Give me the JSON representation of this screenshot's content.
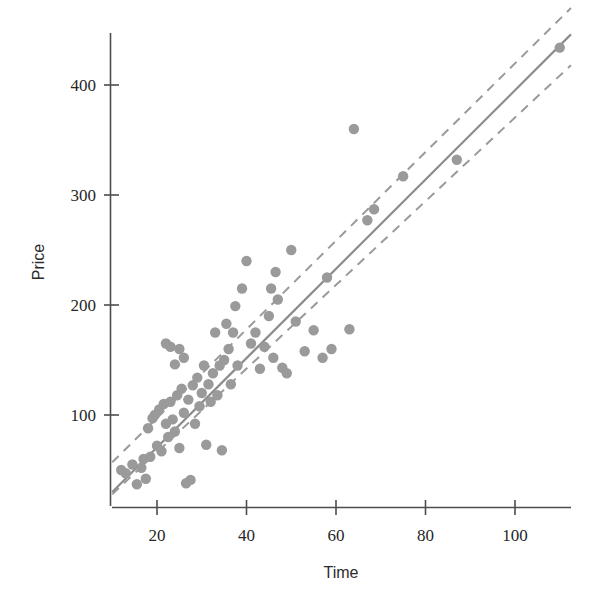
{
  "figure": {
    "title": "",
    "background_color": "#ffffff",
    "width": 606,
    "height": 609
  },
  "axes": {
    "x": {
      "label": "Time",
      "ticks": [
        20,
        40,
        60,
        80,
        100
      ],
      "tick_labels": [
        "20",
        "40",
        "60",
        "80",
        "100"
      ],
      "range": [
        10,
        112.5
      ],
      "axis_color": "#4d4d4d"
    },
    "y": {
      "label": "Price",
      "ticks": [
        100,
        200,
        300,
        400
      ],
      "tick_labels": [
        "100",
        "200",
        "300",
        "400"
      ],
      "range": [
        28,
        457
      ],
      "axis_color": "#4d4d4d"
    }
  },
  "style": {
    "point_color": "#9a9a9a",
    "point_radius": 5.2,
    "fit_line_color": "#8c8c8c",
    "band_line_color": "#9a9a9a",
    "fit_line_width": 2.2,
    "band_line_width": 2.0,
    "band_dash": "9 7",
    "grid": false,
    "legend": "none"
  },
  "chart_data": {
    "type": "scatter",
    "title": "",
    "xlabel": "Time",
    "ylabel": "Price",
    "xlim": [
      10,
      112.5
    ],
    "ylim": [
      28,
      457
    ],
    "xticks": [
      20,
      40,
      60,
      80,
      100
    ],
    "yticks": [
      100,
      200,
      300,
      400
    ],
    "grid": false,
    "legend": "none",
    "series": [
      {
        "name": "observations",
        "marker": "circle",
        "color": "#9a9a9a",
        "x": [
          12.0,
          13.0,
          14.5,
          15.5,
          16.5,
          17.0,
          17.5,
          18.0,
          18.5,
          19.0,
          19.5,
          20.0,
          20.5,
          21.0,
          21.5,
          22.0,
          22.0,
          22.5,
          23.0,
          23.0,
          23.5,
          24.0,
          24.0,
          24.5,
          25.0,
          25.0,
          25.5,
          26.0,
          26.0,
          26.5,
          27.0,
          27.5,
          28.0,
          28.5,
          29.0,
          29.5,
          30.0,
          30.5,
          31.0,
          31.5,
          32.0,
          32.5,
          33.0,
          33.5,
          34.0,
          34.5,
          35.0,
          35.5,
          36.0,
          36.5,
          37.0,
          37.5,
          38.0,
          39.0,
          40.0,
          41.0,
          42.0,
          43.0,
          44.0,
          45.0,
          45.5,
          46.0,
          46.5,
          47.0,
          48.0,
          49.0,
          50.0,
          51.0,
          53.0,
          55.0,
          57.0,
          58.0,
          59.0,
          63.0,
          64.0,
          67.0,
          68.5,
          75.0,
          87.0,
          110.0
        ],
        "y": [
          50,
          47,
          55,
          37,
          52,
          60,
          42,
          88,
          62,
          97,
          100,
          72,
          105,
          67,
          110,
          92,
          165,
          80,
          112,
          162,
          96,
          85,
          146,
          118,
          70,
          160,
          124,
          102,
          152,
          38,
          114,
          41,
          127,
          92,
          134,
          108,
          120,
          145,
          73,
          128,
          112,
          138,
          175,
          118,
          145,
          68,
          150,
          183,
          160,
          128,
          175,
          199,
          145,
          215,
          240,
          165,
          175,
          142,
          162,
          190,
          215,
          152,
          230,
          205,
          143,
          138,
          250,
          185,
          158,
          177,
          152,
          225,
          160,
          178,
          360,
          277,
          287,
          317,
          332,
          434
        ]
      }
    ],
    "fit_line": {
      "name": "least-squares fit",
      "type": "line",
      "style": "solid",
      "color": "#8c8c8c",
      "x": [
        10.0,
        112.5
      ],
      "y": [
        30,
        446
      ]
    },
    "confidence_bands": [
      {
        "name": "upper band",
        "type": "line",
        "style": "dashed",
        "color": "#9a9a9a",
        "x": [
          10.0,
          112.5
        ],
        "y": [
          57,
          470
        ]
      },
      {
        "name": "lower band",
        "type": "line",
        "style": "dashed",
        "color": "#9a9a9a",
        "x": [
          10.0,
          112.5
        ],
        "y": [
          28,
          418
        ]
      }
    ]
  }
}
